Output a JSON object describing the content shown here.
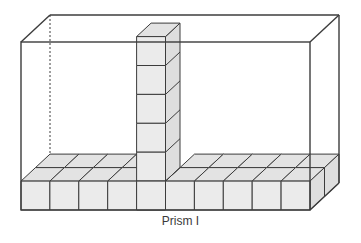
{
  "caption": "Prism I",
  "colors": {
    "edge": "#3c3c3c",
    "cube_face": "#ebebeb",
    "cube_top": "#e3e3e3",
    "cube_side": "#dedede",
    "background": "#ffffff"
  },
  "geometry": {
    "front": {
      "x": 21,
      "y": 42,
      "w": 289,
      "h": 168
    },
    "depth_offset": {
      "dx": 29,
      "dy": -27
    },
    "cube_size": 28.9,
    "base_cubes_across": 10,
    "base_cubes_deep": 2,
    "column_index": 4,
    "column_height_cubes": 5
  }
}
